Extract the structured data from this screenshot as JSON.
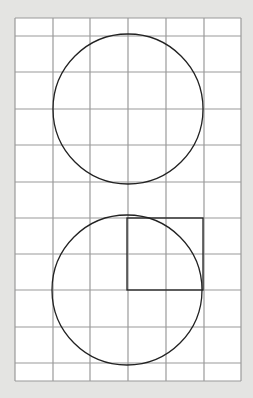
{
  "figure": {
    "background": "#e4e4e2",
    "paper": "#ffffff",
    "grid_color": "#9a9a9a",
    "stroke_color": "#222222",
    "grid": {
      "left": 15,
      "top": 18,
      "right": 241,
      "bottom": 381,
      "vertical_lines": [
        15,
        53,
        90,
        128,
        166,
        204,
        241
      ],
      "horizontal_lines": [
        18,
        36,
        72,
        109,
        145,
        182,
        218,
        254,
        290,
        327,
        363,
        381
      ]
    },
    "shapes": [
      {
        "type": "circle",
        "name": "top-circle",
        "cx": 128,
        "cy": 109,
        "r": 75
      },
      {
        "type": "circle",
        "name": "bottom-circle",
        "cx": 127,
        "cy": 290,
        "r": 75
      },
      {
        "type": "square",
        "name": "radius-square",
        "x": 127,
        "y": 218,
        "width": 76,
        "height": 72
      }
    ]
  }
}
